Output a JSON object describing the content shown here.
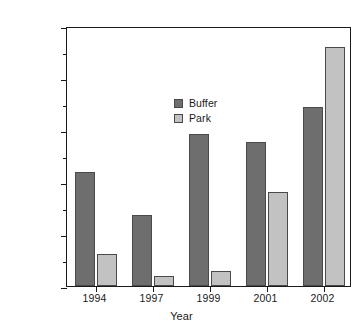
{
  "chart_data": {
    "type": "bar",
    "title": "",
    "xlabel": "Year",
    "ylabel": "Rate of forest loss (ha yr⁻¹)",
    "ylabel_text": "Rate of forest loss (ha yr",
    "ylabel_sup": "−1",
    "ylabel_tail": ")",
    "categories": [
      "1994",
      "1997",
      "1999",
      "2001",
      "2002"
    ],
    "series": [
      {
        "name": "Buffer",
        "color": "#6e6e6e",
        "values": [
          4400,
          2750,
          5850,
          5550,
          6880
        ]
      },
      {
        "name": "Park",
        "color": "#c2c2c2",
        "values": [
          1250,
          380,
          570,
          3630,
          9200
        ]
      }
    ],
    "ylim": [
      0,
      10000
    ],
    "ytick_major": [
      0,
      2000,
      4000,
      6000,
      8000,
      10000
    ],
    "ytick_minor": [
      1000,
      3000,
      5000,
      7000,
      9000
    ],
    "ytick_labels": [
      "0",
      "2000",
      "4000",
      "6000",
      "8000",
      "10000"
    ],
    "grid": false,
    "legend_position": "upper-left-inside",
    "legend_entries": [
      "Buffer",
      "Park"
    ]
  },
  "axes": {
    "y_title_full": "Rate of forest loss (ha yr−1)",
    "x_title": "Year"
  }
}
